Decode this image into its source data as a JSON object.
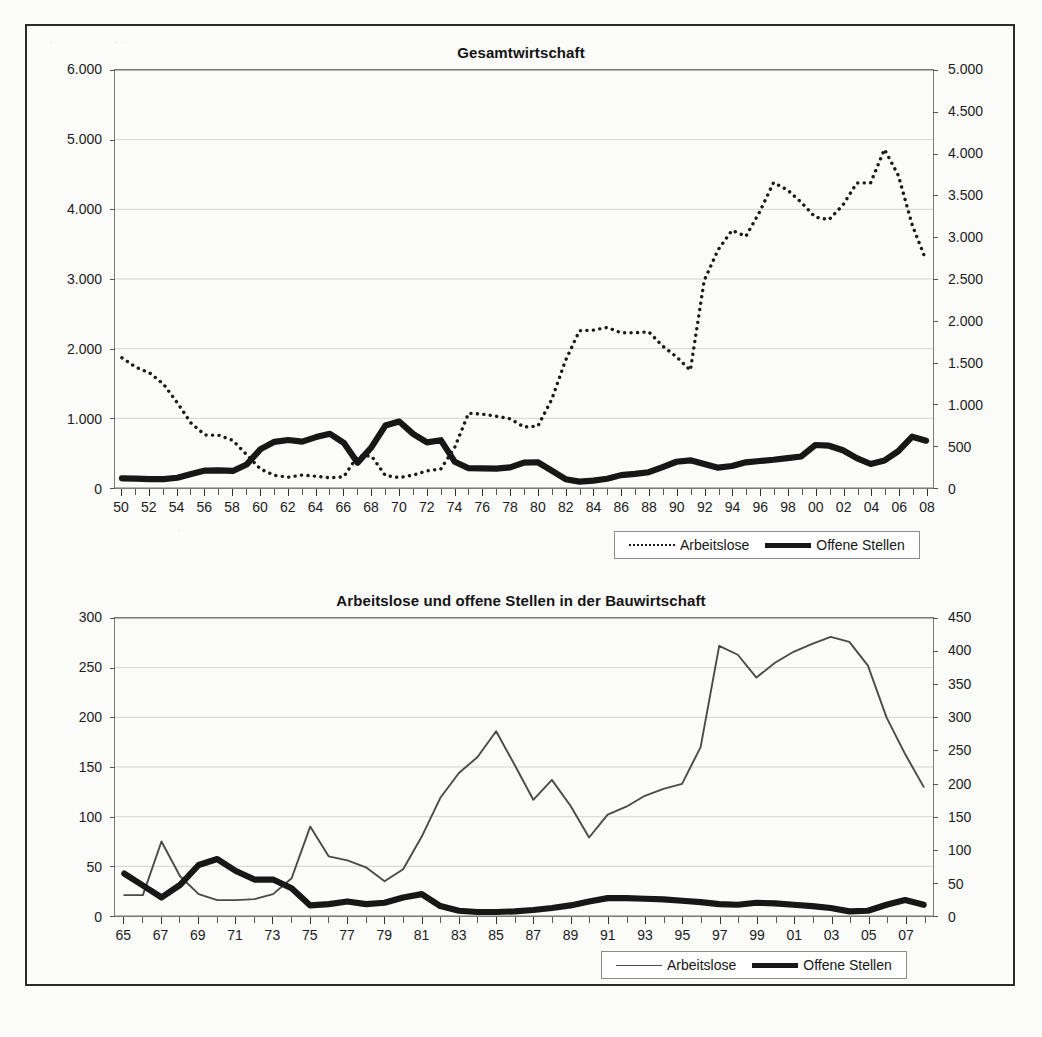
{
  "document": {
    "kind": "scanned-figure-page",
    "frame_border_color": "#2b2b2b"
  },
  "charts": [
    {
      "id": "gesamtwirtschaft",
      "title": "Gesamtwirtschaft",
      "legend": [
        {
          "label": "Arbeitslose",
          "style": "dotted"
        },
        {
          "label": "Offene Stellen",
          "style": "thick"
        }
      ]
    },
    {
      "id": "bauwirtschaft",
      "title": "Arbeitslose und offene Stellen in der Bauwirtschaft",
      "legend": [
        {
          "label": "Arbeitslose",
          "style": "thin"
        },
        {
          "label": "Offene Stellen",
          "style": "thick"
        }
      ]
    }
  ],
  "chart_data": [
    {
      "type": "line",
      "title": "Gesamtwirtschaft",
      "xlabel": "",
      "ylabel": "",
      "grid": true,
      "legend_position": "bottom-right",
      "x": [
        1950,
        1951,
        1952,
        1953,
        1954,
        1955,
        1956,
        1957,
        1958,
        1959,
        1960,
        1961,
        1962,
        1963,
        1964,
        1965,
        1966,
        1967,
        1968,
        1969,
        1970,
        1971,
        1972,
        1973,
        1974,
        1975,
        1976,
        1977,
        1978,
        1979,
        1980,
        1981,
        1982,
        1983,
        1984,
        1985,
        1986,
        1987,
        1988,
        1989,
        1990,
        1991,
        1992,
        1993,
        1994,
        1995,
        1996,
        1997,
        1998,
        1999,
        2000,
        2001,
        2002,
        2003,
        2004,
        2005,
        2006,
        2007,
        2008
      ],
      "tick_labels": [
        "50",
        "52",
        "54",
        "56",
        "58",
        "60",
        "62",
        "64",
        "66",
        "68",
        "70",
        "72",
        "74",
        "76",
        "78",
        "80",
        "82",
        "84",
        "86",
        "88",
        "90",
        "92",
        "94",
        "96",
        "98",
        "00",
        "02",
        "04",
        "06",
        "08"
      ],
      "axes": {
        "left": {
          "label": "Arbeitslose",
          "min": 0,
          "max": 6000,
          "step": 1000,
          "tick_labels": [
            "0",
            "1.000",
            "2.000",
            "3.000",
            "4.000",
            "5.000",
            "6.000"
          ]
        },
        "right": {
          "label": "Offene Stellen",
          "min": 0,
          "max": 5000,
          "step": 500,
          "tick_labels": [
            "0",
            "500",
            "1.000",
            "1.500",
            "2.000",
            "2.500",
            "3.000",
            "3.500",
            "4.000",
            "4.500",
            "5.000"
          ]
        }
      },
      "series": [
        {
          "name": "Arbeitslose",
          "axis": "left",
          "style": "dotted",
          "color": "#1a1a1a",
          "values": [
            1869,
            1735,
            1651,
            1491,
            1221,
            928,
            761,
            756,
            683,
            476,
            271,
            181,
            155,
            186,
            169,
            147,
            161,
            459,
            459,
            179,
            149,
            185,
            246,
            273,
            582,
            1074,
            1060,
            1030,
            993,
            876,
            889,
            1272,
            1833,
            2258,
            2266,
            2304,
            2228,
            2229,
            2242,
            2038,
            1883,
            1689,
            2979,
            3419,
            3698,
            3612,
            3965,
            4384,
            4279,
            4100,
            3889,
            3852,
            4061,
            4377,
            4381,
            4861,
            4487,
            3776,
            3268
          ]
        },
        {
          "name": "Offene Stellen",
          "axis": "right",
          "style": "thick",
          "color": "#171717",
          "values": [
            116,
            112,
            106,
            107,
            122,
            168,
            208,
            210,
            204,
            282,
            465,
            552,
            574,
            555,
            609,
            649,
            540,
            302,
            488,
            747,
            795,
            648,
            546,
            572,
            315,
            236,
            235,
            231,
            246,
            304,
            308,
            208,
            105,
            76,
            88,
            110,
            154,
            169,
            189,
            251,
            314,
            331,
            288,
            243,
            263,
            307,
            323,
            338,
            358,
            377,
            514,
            506,
            451,
            358,
            287,
            329,
            441,
            614,
            566
          ]
        }
      ]
    },
    {
      "type": "line",
      "title": "Arbeitslose und offene Stellen in der Bauwirtschaft",
      "xlabel": "",
      "ylabel": "",
      "grid": true,
      "legend_position": "bottom-right",
      "x": [
        1965,
        1966,
        1967,
        1968,
        1969,
        1970,
        1971,
        1972,
        1973,
        1974,
        1975,
        1976,
        1977,
        1978,
        1979,
        1980,
        1981,
        1982,
        1983,
        1984,
        1985,
        1986,
        1987,
        1988,
        1989,
        1990,
        1991,
        1992,
        1993,
        1994,
        1995,
        1996,
        1997,
        1998,
        1999,
        2000,
        2001,
        2002,
        2003,
        2004,
        2005,
        2006,
        2007,
        2008
      ],
      "tick_labels": [
        "65",
        "67",
        "69",
        "71",
        "73",
        "75",
        "77",
        "79",
        "81",
        "83",
        "85",
        "87",
        "89",
        "91",
        "93",
        "95",
        "97",
        "99",
        "01",
        "03",
        "05",
        "07"
      ],
      "axes": {
        "left": {
          "label": "Arbeitslose",
          "min": 0,
          "max": 300,
          "step": 50,
          "tick_labels": [
            "0",
            "50",
            "100",
            "150",
            "200",
            "250",
            "300"
          ]
        },
        "right": {
          "label": "Offene Stellen",
          "min": 0,
          "max": 450,
          "step": 50,
          "tick_labels": [
            "0",
            "50",
            "100",
            "150",
            "200",
            "250",
            "300",
            "350",
            "400",
            "450"
          ]
        }
      },
      "series": [
        {
          "name": "Arbeitslose",
          "axis": "left",
          "style": "thin",
          "color": "#4a4a4a",
          "values": [
            21,
            21,
            75,
            40,
            22,
            16,
            16,
            17,
            22,
            38,
            90,
            60,
            56,
            49,
            35,
            47,
            80,
            119,
            144,
            160,
            186,
            152,
            117,
            137,
            111,
            79,
            102,
            110,
            121,
            128,
            133,
            170,
            272,
            263,
            240,
            255,
            266,
            274,
            281,
            276,
            252,
            200,
            163,
            130
          ]
        },
        {
          "name": "Offene Stellen",
          "axis": "right",
          "style": "thick",
          "color": "#171717",
          "values": [
            64,
            46,
            28,
            47,
            77,
            86,
            68,
            55,
            55,
            42,
            16,
            18,
            22,
            18,
            20,
            28,
            33,
            15,
            8,
            6,
            6,
            7,
            9,
            12,
            16,
            22,
            27,
            27,
            26,
            25,
            23,
            21,
            18,
            17,
            20,
            19,
            17,
            15,
            12,
            7,
            8,
            17,
            24,
            17
          ]
        }
      ]
    }
  ]
}
